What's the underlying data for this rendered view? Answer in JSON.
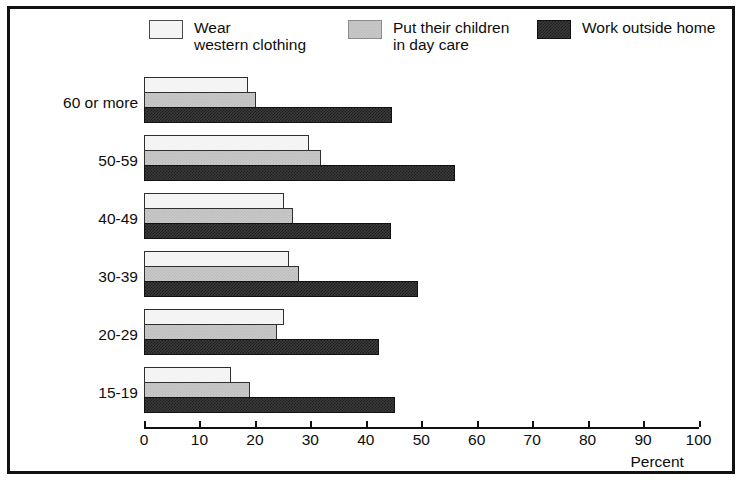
{
  "chart_data": {
    "type": "bar",
    "orientation": "horizontal",
    "title": "",
    "xlabel": "Percent",
    "ylabel": "",
    "xlim": [
      0,
      100
    ],
    "xticks": [
      0,
      10,
      20,
      30,
      40,
      50,
      60,
      70,
      80,
      90,
      100
    ],
    "grid": false,
    "legend_position": "top",
    "categories": [
      "60 or more",
      "50-59",
      "40-49",
      "30-39",
      "20-29",
      "15-19"
    ],
    "series": [
      {
        "name": "Wear\nwestern clothing",
        "legend_label": "Wear\nwestern clothing",
        "swatch": "white",
        "color": "#f4f4f4",
        "values": [
          18.8,
          29.8,
          25.2,
          26.2,
          25.2,
          15.7
        ]
      },
      {
        "name": "Put their children\nin day care",
        "legend_label": "Put their children\nin day care",
        "swatch": "gray",
        "color": "#c9c9c9",
        "values": [
          20.2,
          31.9,
          26.9,
          27.9,
          24.0,
          19.1
        ]
      },
      {
        "name": "Work outside home",
        "legend_label": "Work outside home",
        "swatch": "dark",
        "color": "#3c3c3c",
        "values": [
          44.7,
          56.0,
          44.5,
          49.4,
          42.3,
          45.2
        ]
      }
    ]
  },
  "axis": {
    "tick_labels": [
      "0",
      "10",
      "20",
      "30",
      "40",
      "50",
      "60",
      "70",
      "80",
      "90",
      "100"
    ],
    "percent_label": "Percent"
  },
  "legend": {
    "items": [
      {
        "label": "Wear\nwestern clothing",
        "swatch": "white"
      },
      {
        "label": "Put their children\nin day care",
        "swatch": "gray"
      },
      {
        "label": "Work outside home",
        "swatch": "dark"
      }
    ]
  },
  "colors": {
    "series_white": "#f4f4f4",
    "series_gray": "#c9c9c9",
    "series_dark": "#3c3c3c",
    "frame": "#111111",
    "text": "#0d0d0d",
    "background": "#ffffff"
  }
}
